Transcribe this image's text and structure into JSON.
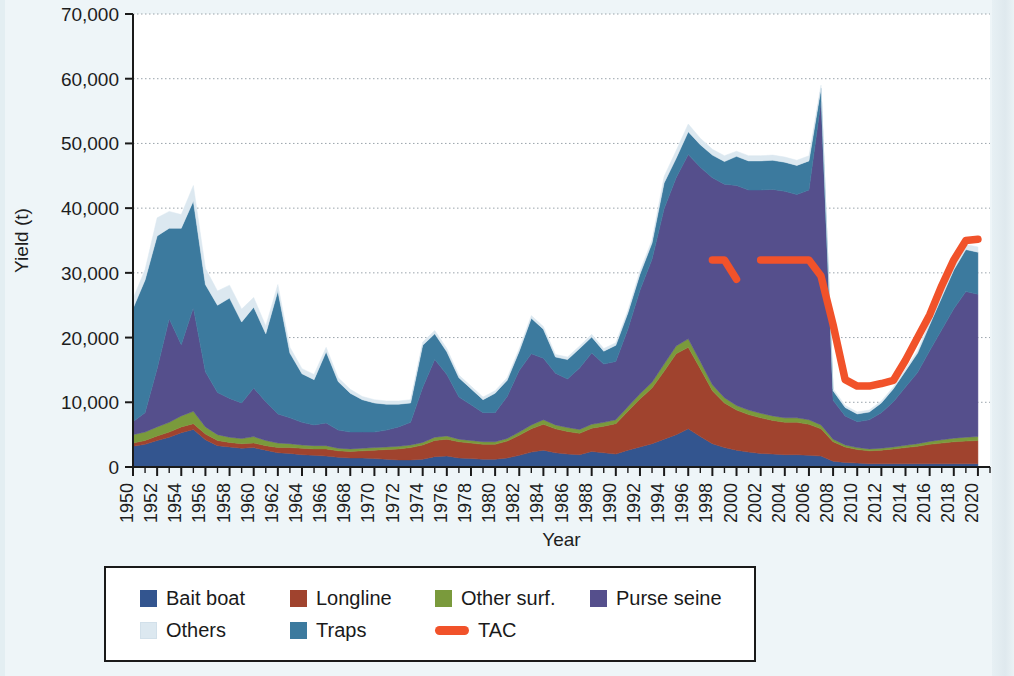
{
  "figure": {
    "background_color": "#eef5f8",
    "plot_background_color": "#ffffff"
  },
  "axes": {
    "y_label": "Yield (t)",
    "x_label": "Year",
    "y_ticks": [
      "0",
      "10,000",
      "20,000",
      "30,000",
      "40,000",
      "50,000",
      "60,000",
      "70,000"
    ],
    "x_ticks": [
      "1950",
      "1952",
      "1954",
      "1956",
      "1958",
      "1960",
      "1962",
      "1964",
      "1966",
      "1968",
      "1970",
      "1972",
      "1974",
      "1976",
      "1978",
      "1980",
      "1982",
      "1984",
      "1986",
      "1988",
      "1990",
      "1992",
      "1994",
      "1996",
      "1998",
      "2000",
      "2002",
      "2004",
      "2006",
      "2008",
      "2010",
      "2012",
      "2014",
      "2016",
      "2018",
      "2020"
    ]
  },
  "legend": {
    "rows": [
      [
        {
          "label": "Bait boat",
          "color": "#33558f",
          "kind": "swatch",
          "name": "bait-boat"
        },
        {
          "label": "Longline",
          "color": "#a0432e",
          "kind": "swatch",
          "name": "longline"
        },
        {
          "label": "Other surf.",
          "color": "#7a9a3c",
          "kind": "swatch",
          "name": "other-surf"
        },
        {
          "label": "Purse seine",
          "color": "#554f8c",
          "kind": "swatch",
          "name": "purse-seine"
        }
      ],
      [
        {
          "label": "Others",
          "color": "#dce8f0",
          "kind": "swatch",
          "name": "others"
        },
        {
          "label": "Traps",
          "color": "#3c7a9e",
          "kind": "swatch",
          "name": "traps"
        },
        {
          "label": "TAC",
          "color": "#f1522a",
          "kind": "line",
          "name": "tac"
        }
      ]
    ]
  },
  "chart_data": {
    "type": "area",
    "title": "",
    "xlabel": "Year",
    "ylabel": "Yield (t)",
    "xlim": [
      1950,
      2021
    ],
    "ylim": [
      0,
      70000
    ],
    "grid": true,
    "stacked": true,
    "legend_position": "bottom",
    "x": [
      1950,
      1951,
      1952,
      1953,
      1954,
      1955,
      1956,
      1957,
      1958,
      1959,
      1960,
      1961,
      1962,
      1963,
      1964,
      1965,
      1966,
      1967,
      1968,
      1969,
      1970,
      1971,
      1972,
      1973,
      1974,
      1975,
      1976,
      1977,
      1978,
      1979,
      1980,
      1981,
      1982,
      1983,
      1984,
      1985,
      1986,
      1987,
      1988,
      1989,
      1990,
      1991,
      1992,
      1993,
      1994,
      1995,
      1996,
      1997,
      1998,
      1999,
      2000,
      2001,
      2002,
      2003,
      2004,
      2005,
      2006,
      2007,
      2008,
      2009,
      2010,
      2011,
      2012,
      2013,
      2014,
      2015,
      2016,
      2017,
      2018,
      2019,
      2020
    ],
    "series": [
      {
        "name": "Bait boat",
        "color": "#33558f",
        "values": [
          3200,
          3500,
          4100,
          4600,
          5300,
          5800,
          4200,
          3300,
          3100,
          2900,
          3000,
          2600,
          2200,
          2100,
          1900,
          1800,
          1700,
          1500,
          1400,
          1400,
          1300,
          1200,
          1100,
          1100,
          1200,
          1600,
          1700,
          1400,
          1300,
          1200,
          1200,
          1400,
          1800,
          2300,
          2600,
          2200,
          2000,
          1900,
          2400,
          2200,
          2000,
          2600,
          3100,
          3600,
          4300,
          5000,
          5900,
          4700,
          3600,
          3000,
          2600,
          2300,
          2100,
          2000,
          1900,
          1900,
          1800,
          1700,
          900,
          700,
          600,
          500,
          500,
          500,
          500,
          500,
          500,
          500,
          500,
          500,
          500
        ]
      },
      {
        "name": "Longline",
        "color": "#a0432e",
        "values": [
          500,
          600,
          700,
          800,
          900,
          900,
          900,
          800,
          700,
          700,
          700,
          700,
          800,
          900,
          1000,
          1000,
          1100,
          1000,
          1000,
          1100,
          1300,
          1500,
          1700,
          1900,
          2200,
          2500,
          2600,
          2500,
          2400,
          2300,
          2300,
          2600,
          3100,
          3600,
          4000,
          3700,
          3500,
          3300,
          3600,
          4100,
          4700,
          6000,
          7400,
          8600,
          10500,
          12500,
          12600,
          10500,
          8200,
          6900,
          6200,
          5800,
          5500,
          5200,
          5000,
          5000,
          4800,
          4200,
          3000,
          2400,
          2100,
          2000,
          2100,
          2300,
          2500,
          2700,
          3000,
          3200,
          3400,
          3500,
          3600
        ]
      },
      {
        "name": "Other surf.",
        "color": "#7a9a3c",
        "values": [
          1300,
          1300,
          1400,
          1500,
          1700,
          1900,
          1100,
          900,
          800,
          800,
          1000,
          800,
          700,
          600,
          500,
          500,
          500,
          400,
          400,
          400,
          400,
          400,
          400,
          400,
          400,
          500,
          500,
          400,
          400,
          400,
          400,
          400,
          500,
          600,
          700,
          600,
          600,
          600,
          600,
          600,
          600,
          700,
          800,
          900,
          1100,
          1200,
          1300,
          1100,
          900,
          800,
          700,
          700,
          700,
          700,
          700,
          700,
          700,
          600,
          400,
          300,
          300,
          300,
          300,
          300,
          350,
          400,
          450,
          500,
          550,
          600,
          600
        ]
      },
      {
        "name": "Purse seine",
        "color": "#554f8c",
        "values": [
          2000,
          3000,
          9000,
          16000,
          11000,
          16000,
          8500,
          6500,
          6000,
          5500,
          7500,
          6000,
          4500,
          4000,
          3500,
          3200,
          3500,
          2800,
          2600,
          2500,
          2400,
          2600,
          3000,
          3500,
          8500,
          12000,
          9500,
          6500,
          5500,
          4500,
          4500,
          6500,
          9500,
          11000,
          9500,
          8000,
          7500,
          9500,
          11000,
          9000,
          9000,
          12000,
          16000,
          19000,
          24000,
          26000,
          28500,
          30000,
          32000,
          33000,
          34000,
          34000,
          34500,
          35000,
          35000,
          34500,
          35500,
          50000,
          6000,
          4500,
          4000,
          4500,
          5500,
          7000,
          9000,
          11000,
          14000,
          17000,
          20000,
          22500,
          22000
        ]
      },
      {
        "name": "Traps",
        "color": "#3c7a9e",
        "values": [
          17500,
          20500,
          20500,
          14000,
          18000,
          16500,
          13500,
          13500,
          15500,
          12500,
          12500,
          10500,
          19000,
          10000,
          7500,
          7000,
          11000,
          7500,
          6000,
          5000,
          4500,
          4000,
          3500,
          3000,
          6500,
          4000,
          3500,
          3000,
          2500,
          2000,
          3000,
          2500,
          3000,
          5500,
          4500,
          2500,
          3000,
          3000,
          2500,
          2000,
          2500,
          2500,
          2500,
          2500,
          4000,
          3000,
          3500,
          3500,
          3500,
          3500,
          4500,
          4500,
          4500,
          4500,
          4500,
          4500,
          4500,
          2000,
          1500,
          1300,
          1200,
          1200,
          1500,
          2000,
          2500,
          3000,
          4000,
          5000,
          6000,
          6500,
          6500
        ]
      },
      {
        "name": "Others",
        "color": "#dce8f0",
        "values": [
          1500,
          1600,
          2800,
          2600,
          2100,
          2400,
          2500,
          2200,
          2000,
          2000,
          1500,
          1200,
          1000,
          900,
          800,
          800,
          700,
          600,
          600,
          500,
          500,
          500,
          500,
          500,
          500,
          500,
          500,
          400,
          400,
          400,
          400,
          400,
          400,
          400,
          400,
          400,
          400,
          400,
          400,
          400,
          400,
          400,
          500,
          500,
          1000,
          1200,
          1200,
          1000,
          900,
          900,
          800,
          800,
          800,
          800,
          800,
          800,
          800,
          500,
          300,
          300,
          300,
          300,
          300,
          300,
          300,
          400,
          500,
          600,
          700,
          800,
          800
        ]
      }
    ],
    "tac": {
      "name": "TAC",
      "color": "#f1522a",
      "segments": [
        {
          "x": [
            1998,
            1999,
            2000
          ],
          "y": [
            32000,
            32000,
            29000
          ]
        },
        {
          "x": [
            2002,
            2003,
            2004,
            2005,
            2006,
            2007,
            2008,
            2009,
            2010,
            2011,
            2012,
            2013,
            2014,
            2015,
            2016,
            2017,
            2018,
            2019,
            2020
          ],
          "y": [
            32000,
            32000,
            32000,
            32000,
            32000,
            29500,
            22000,
            13500,
            12500,
            12500,
            12900,
            13400,
            16500,
            20000,
            23500,
            28000,
            32000,
            35000,
            35200
          ]
        }
      ]
    }
  }
}
